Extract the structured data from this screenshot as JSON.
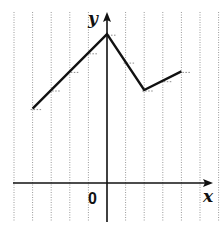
{
  "chart_data": {
    "type": "line",
    "title": "",
    "xlabel": "x",
    "ylabel": "y",
    "origin_label": "0",
    "grid": {
      "vertical_lines": true,
      "horizontal_lines": false,
      "style": "dotted"
    },
    "xlim": [
      -5,
      5.7
    ],
    "ylim": [
      -2,
      9
    ],
    "series": [
      {
        "name": "f(x)",
        "x": [
          -4,
          0,
          2,
          4
        ],
        "y": [
          4,
          8,
          5,
          6
        ]
      }
    ],
    "helper_marks": [
      {
        "x": -4,
        "y": 4
      },
      {
        "x": -3,
        "y": 5
      },
      {
        "x": -2,
        "y": 6
      },
      {
        "x": -1,
        "y": 7
      },
      {
        "x": 0,
        "y": 8
      },
      {
        "x": 1,
        "y": 6.5
      },
      {
        "x": 2,
        "y": 5
      },
      {
        "x": 3,
        "y": 5.5
      },
      {
        "x": 4,
        "y": 6
      }
    ],
    "colors": {
      "line": "#111111",
      "axes": "#111111",
      "grid": "#9a9a9a"
    }
  },
  "labels": {
    "x_axis": "x",
    "y_axis": "y",
    "origin": "0"
  }
}
